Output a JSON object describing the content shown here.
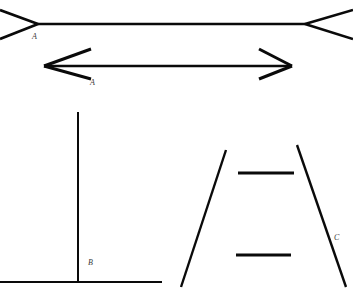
{
  "figure": {
    "background_color": "#ffffff",
    "line_color": "#0a0a0a",
    "label_color": "#3a3a3a",
    "width": 353,
    "height": 296
  },
  "illusions": [
    {
      "id": "muller-lyer-outward",
      "name": "Muller-Lyer line with outward fins",
      "label": "A",
      "label_x": 32,
      "label_y": 39,
      "shaft": {
        "x1": 38,
        "y1": 24,
        "x2": 305,
        "y2": 24,
        "width": 2.6
      },
      "fins": [
        {
          "x1": 38,
          "y1": 24,
          "x2": 0,
          "y2": 10,
          "width": 2.6
        },
        {
          "x1": 38,
          "y1": 24,
          "x2": 0,
          "y2": 39,
          "width": 2.6
        },
        {
          "x1": 305,
          "y1": 24,
          "x2": 353,
          "y2": 10,
          "width": 2.6
        },
        {
          "x1": 305,
          "y1": 24,
          "x2": 353,
          "y2": 39,
          "width": 2.6
        }
      ]
    },
    {
      "id": "muller-lyer-inward",
      "name": "Muller-Lyer line with inward arrowheads",
      "label": "A",
      "label_x": 90,
      "label_y": 85,
      "shaft": {
        "x1": 44,
        "y1": 66,
        "x2": 292,
        "y2": 66,
        "width": 2.6
      },
      "fins": [
        {
          "x1": 44,
          "y1": 66,
          "x2": 91,
          "y2": 49,
          "width": 3.0
        },
        {
          "x1": 44,
          "y1": 66,
          "x2": 91,
          "y2": 79,
          "width": 3.0
        },
        {
          "x1": 292,
          "y1": 66,
          "x2": 259,
          "y2": 49,
          "width": 3.0
        },
        {
          "x1": 292,
          "y1": 66,
          "x2": 259,
          "y2": 79,
          "width": 3.0
        }
      ]
    },
    {
      "id": "vertical-horizontal",
      "name": "Vertical-horizontal inverted T illusion",
      "label": "B",
      "label_x": 88,
      "label_y": 265,
      "segments": [
        {
          "x1": 78,
          "y1": 112,
          "x2": 78,
          "y2": 282,
          "width": 2.0
        },
        {
          "x1": 0,
          "y1": 282,
          "x2": 162,
          "y2": 282,
          "width": 2.0
        }
      ]
    },
    {
      "id": "ponzo",
      "name": "Ponzo converging lines illusion",
      "label": "C",
      "label_x": 334,
      "label_y": 240,
      "segments": [
        {
          "x1": 226,
          "y1": 150,
          "x2": 181,
          "y2": 287,
          "width": 2.4
        },
        {
          "x1": 297,
          "y1": 145,
          "x2": 346,
          "y2": 287,
          "width": 2.4
        },
        {
          "x1": 238,
          "y1": 173,
          "x2": 294,
          "y2": 173,
          "width": 3.0
        },
        {
          "x1": 236,
          "y1": 255,
          "x2": 291,
          "y2": 255,
          "width": 3.0
        }
      ]
    }
  ]
}
